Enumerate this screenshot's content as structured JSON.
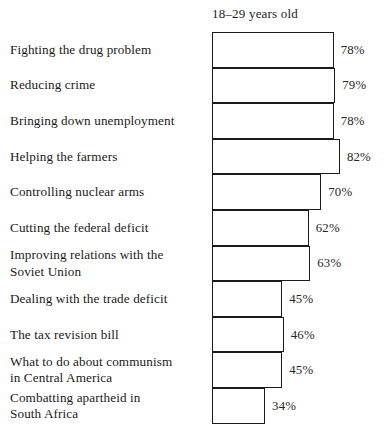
{
  "chart_data": {
    "type": "bar",
    "orientation": "horizontal",
    "title": "18–29 years old",
    "xlabel": "",
    "ylabel": "",
    "xlim": [
      0,
      100
    ],
    "grid": false,
    "legend": null,
    "value_suffix": "%",
    "categories": [
      "Fighting the drug problem",
      "Reducing crime",
      "Bringing down unemployment",
      "Helping the farmers",
      "Controlling nuclear arms",
      "Cutting the federal deficit",
      "Improving relations with the Soviet Union",
      "Dealing with the trade deficit",
      "The tax revision bill",
      "What to do about communism in Central America",
      "Combatting apartheid in South Africa"
    ],
    "values": [
      78,
      79,
      78,
      82,
      70,
      62,
      63,
      45,
      46,
      45,
      34
    ],
    "value_labels": [
      "78%",
      "79%",
      "78%",
      "82%",
      "70%",
      "62%",
      "63%",
      "45%",
      "46%",
      "45%",
      "34%"
    ],
    "rows": [
      {
        "label_lines": [
          "Fighting the drug problem"
        ],
        "value": 78,
        "value_label": "78%"
      },
      {
        "label_lines": [
          "Reducing crime"
        ],
        "value": 79,
        "value_label": "79%"
      },
      {
        "label_lines": [
          "Bringing down unemployment"
        ],
        "value": 78,
        "value_label": "78%"
      },
      {
        "label_lines": [
          "Helping the farmers"
        ],
        "value": 82,
        "value_label": "82%"
      },
      {
        "label_lines": [
          "Controlling nuclear arms"
        ],
        "value": 70,
        "value_label": "70%"
      },
      {
        "label_lines": [
          "Cutting the federal deficit"
        ],
        "value": 62,
        "value_label": "62%"
      },
      {
        "label_lines": [
          "Improving relations with the",
          "Soviet Union"
        ],
        "value": 63,
        "value_label": "63%"
      },
      {
        "label_lines": [
          "Dealing with the trade deficit"
        ],
        "value": 45,
        "value_label": "45%"
      },
      {
        "label_lines": [
          "The tax revision bill"
        ],
        "value": 46,
        "value_label": "46%"
      },
      {
        "label_lines": [
          "What to do about communism",
          "in Central America"
        ],
        "value": 45,
        "value_label": "45%"
      },
      {
        "label_lines": [
          "Combatting apartheid in",
          "South Africa"
        ],
        "value": 34,
        "value_label": "34%"
      }
    ]
  },
  "style": {
    "bar_fill": "#ffffff",
    "bar_stroke": "#1b1b1b",
    "text_color": "#1a1a1a",
    "background": "#ffffff",
    "px_per_percent": 1.56,
    "bar_origin_x": 212,
    "row_height": 35.6
  },
  "bottom_caption": ""
}
